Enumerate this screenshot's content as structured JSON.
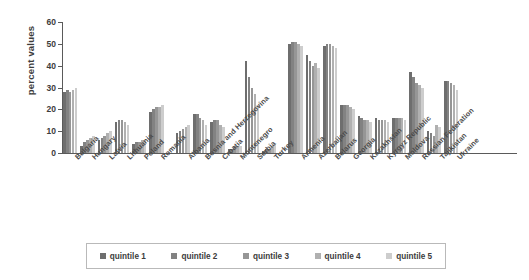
{
  "chart": {
    "type": "bar",
    "title": "",
    "xlabel": "",
    "ylabel": "percent values"
  },
  "axis": {
    "y_ticks": [
      "0",
      "10",
      "20",
      "30",
      "40",
      "50",
      "60"
    ],
    "ylim_min": 0,
    "ylim_max": 60
  },
  "legend": {
    "items": [
      {
        "label": "quintile 1",
        "color": "#6e6e6e"
      },
      {
        "label": "quintile 2",
        "color": "#828282"
      },
      {
        "label": "quintile 3",
        "color": "#969696"
      },
      {
        "label": "quintile 4",
        "color": "#b0b0b0"
      },
      {
        "label": "quintile 5",
        "color": "#cdcdcd"
      }
    ]
  },
  "chart_data": {
    "type": "bar",
    "title": "",
    "xlabel": "",
    "ylabel": "percent values",
    "ylim": [
      0,
      60
    ],
    "grid": false,
    "legend_position": "bottom",
    "categories": [
      "Bulgaria",
      "Hungary",
      "Latvia",
      "Lithuania",
      "Poland",
      "Romania",
      "Albania",
      "Bosnia and Herzegovina",
      "Croatia",
      "Montenegro",
      "Serbia",
      "Turkey",
      "Armenia",
      "Azerbaijan",
      "Belarus",
      "Georgia",
      "Kazakhstan",
      "Kyrgyz Republic",
      "Moldova",
      "Russian Federation",
      "Tajikistan",
      "Ukraine"
    ],
    "groups": [
      {
        "name": "Central and Eastern Europe",
        "categories": [
          "Bulgaria",
          "Hungary",
          "Latvia",
          "Lithuania",
          "Poland",
          "Romania"
        ]
      },
      {
        "name": "Western Balkans and Turkey",
        "categories": [
          "Albania",
          "Bosnia and Herzegovina",
          "Croatia",
          "Montenegro",
          "Serbia",
          "Turkey"
        ]
      },
      {
        "name": "Commonwealth of Independent States",
        "categories": [
          "Armenia",
          "Azerbaijan",
          "Belarus",
          "Georgia",
          "Kazakhstan",
          "Kyrgyz Republic",
          "Moldova",
          "Russian Federation",
          "Tajikistan",
          "Ukraine"
        ]
      }
    ],
    "series": [
      {
        "name": "quintile 1",
        "color": "#6e6e6e",
        "values": [
          28,
          3,
          6,
          14,
          4,
          19,
          9,
          18,
          14,
          2,
          42,
          1,
          50,
          45,
          49,
          22,
          17,
          16,
          16,
          37,
          10,
          33
        ]
      },
      {
        "name": "quintile 2",
        "color": "#828282",
        "values": [
          29,
          5,
          7,
          15,
          5,
          20,
          10,
          18,
          15,
          2,
          35,
          2,
          51,
          42,
          50,
          22,
          16,
          15,
          16,
          35,
          9,
          33
        ]
      },
      {
        "name": "quintile 3",
        "color": "#969696",
        "values": [
          28,
          6,
          8,
          15,
          5,
          21,
          11,
          16,
          15,
          3,
          30,
          2,
          51,
          40,
          50,
          22,
          15,
          15,
          16,
          32,
          8,
          32
        ]
      },
      {
        "name": "quintile 4",
        "color": "#b0b0b0",
        "values": [
          29,
          7,
          9,
          14,
          6,
          21,
          12,
          15,
          13,
          3,
          27,
          3,
          50,
          41,
          49,
          21,
          15,
          15,
          16,
          31,
          13,
          31
        ]
      },
      {
        "name": "quintile 5",
        "color": "#cdcdcd",
        "values": [
          30,
          8,
          10,
          13,
          6,
          22,
          13,
          13,
          12,
          3,
          22,
          4,
          49,
          39,
          48,
          20,
          14,
          14,
          15,
          30,
          12,
          29
        ]
      }
    ]
  }
}
